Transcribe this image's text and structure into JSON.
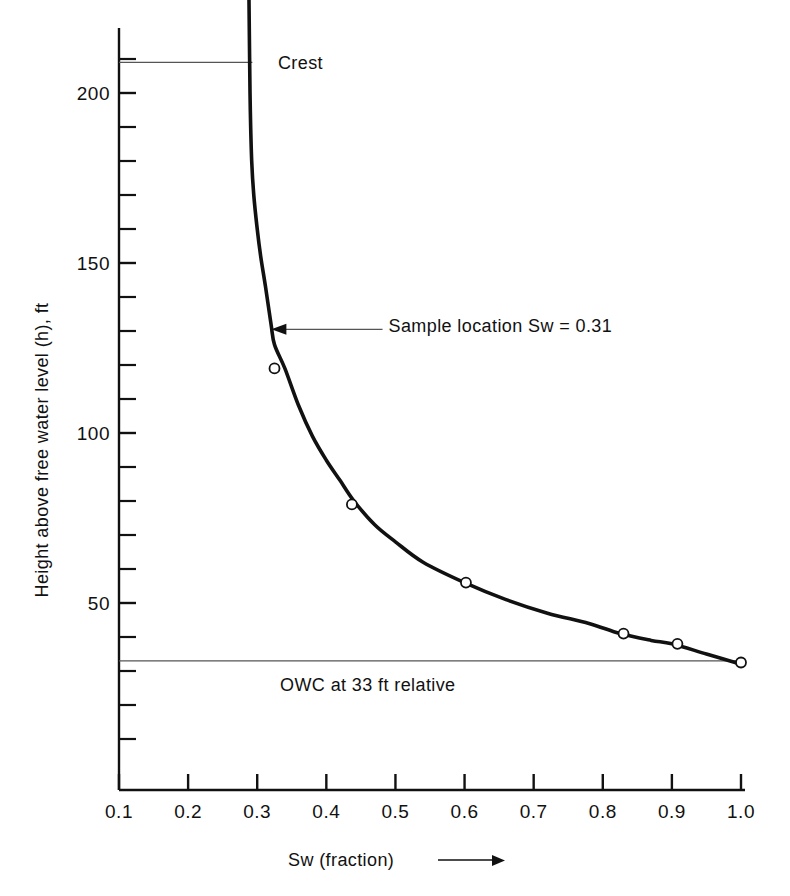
{
  "chart_data": {
    "type": "line",
    "title": "",
    "xlabel": "Sw (fraction)",
    "ylabel": "Height above free water level (h), ft",
    "xlim": [
      0.1,
      1.0
    ],
    "ylim": [
      0,
      230
    ],
    "grid": false,
    "legend": "none",
    "series": [
      {
        "name": "Capillary pressure saturation curve",
        "x": [
          0.288,
          0.289,
          0.29,
          0.292,
          0.295,
          0.3,
          0.305,
          0.312,
          0.32,
          0.325,
          0.34,
          0.36,
          0.38,
          0.4,
          0.42,
          0.44,
          0.47,
          0.5,
          0.54,
          0.6,
          0.66,
          0.72,
          0.78,
          0.825,
          0.87,
          0.9,
          0.95,
          1.0
        ],
        "y": [
          229.0,
          210.0,
          195.0,
          180.0,
          170.0,
          160.0,
          152.0,
          143.0,
          132.0,
          126.0,
          119.0,
          108.0,
          99.0,
          92.0,
          86.0,
          80.0,
          73.0,
          68.0,
          62.0,
          56.0,
          51.0,
          47.0,
          44.0,
          41.0,
          39.0,
          38.0,
          35.0,
          32.0
        ]
      }
    ],
    "markers": [
      {
        "x": 0.325,
        "y": 119.0,
        "label": "sample point 1"
      },
      {
        "x": 0.437,
        "y": 79.0,
        "label": "sample point 2"
      },
      {
        "x": 0.602,
        "y": 56.0,
        "label": "sample point 3"
      },
      {
        "x": 0.83,
        "y": 41.0,
        "label": "sample point 4"
      },
      {
        "x": 0.908,
        "y": 38.0,
        "label": "sample point 5"
      },
      {
        "x": 1.0,
        "y": 32.5,
        "label": "sample point 6"
      }
    ],
    "annotations": [
      {
        "name": "crest",
        "text": "Crest",
        "y": 209.0,
        "line_from_x": 0.1,
        "line_to_x": 0.293,
        "text_x": 0.33
      },
      {
        "name": "sample-location",
        "text": "Sample location  Sw = 0.31",
        "arrow_tip_x": 0.319,
        "arrow_tip_y": 130.5,
        "text_x": 0.49,
        "text_y": 131.5
      },
      {
        "name": "owc",
        "text": "OWC at 33 ft relative",
        "y": 33.0,
        "line_from_x": 0.1,
        "line_to_x": 1.0,
        "text_x": 0.46,
        "text_y": 24.0
      }
    ],
    "x_ticks": [
      {
        "value": 0.1,
        "label": "0.1"
      },
      {
        "value": 0.2,
        "label": "0.2"
      },
      {
        "value": 0.3,
        "label": "0.3"
      },
      {
        "value": 0.4,
        "label": "0.4"
      },
      {
        "value": 0.5,
        "label": "0.5"
      },
      {
        "value": 0.6,
        "label": "0.6"
      },
      {
        "value": 0.7,
        "label": "0.7"
      },
      {
        "value": 0.8,
        "label": "0.8"
      },
      {
        "value": 0.9,
        "label": "0.9"
      },
      {
        "value": 1.0,
        "label": "1.0"
      }
    ],
    "y_major_ticks": [
      {
        "value": 50,
        "label": "50"
      },
      {
        "value": 100,
        "label": "100"
      },
      {
        "value": 150,
        "label": "150"
      },
      {
        "value": 200,
        "label": "200"
      }
    ],
    "y_minor_tick_values": [
      10,
      20,
      30,
      40,
      60,
      70,
      80,
      90,
      110,
      120,
      130,
      140,
      160,
      170,
      180,
      190,
      210,
      220
    ],
    "x_axis_arrow": true,
    "colors": {
      "curve": "#111111",
      "axis": "#111111",
      "annotation_line": "#555555",
      "marker_fill": "#ffffff",
      "background": "#ffffff"
    }
  }
}
